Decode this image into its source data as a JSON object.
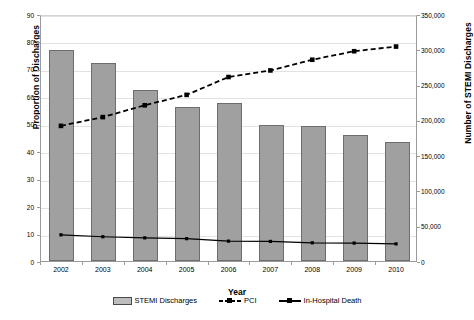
{
  "chart_data": {
    "type": "bar",
    "title": "",
    "xlabel": "Year",
    "ylabel": "Proportion of Discharges",
    "ylabel_secondary": "Number of STEMI Discharges",
    "categories": [
      "2002",
      "2003",
      "2004",
      "2005",
      "2006",
      "2007",
      "2008",
      "2009",
      "2010"
    ],
    "ylim": [
      0,
      90
    ],
    "yticks": [
      "0",
      "10",
      "20",
      "30",
      "40",
      "50",
      "60",
      "70",
      "80",
      "90"
    ],
    "ylim_secondary": [
      0,
      350000
    ],
    "yticks_secondary": [
      "0",
      "50,000",
      "100,000",
      "150,000",
      "200,000",
      "250,000",
      "300,000",
      "350,000"
    ],
    "grid": true,
    "legend_position": "bottom",
    "series": [
      {
        "name": "STEMI Discharges",
        "kind": "bar",
        "axis": "right",
        "color": "#a0a0a0",
        "values": [
          300000,
          281000,
          242000,
          218000,
          224000,
          192000,
          191000,
          178000,
          168000
        ],
        "values_left_axis": [
          77.0,
          72.2,
          62.3,
          56.0,
          57.5,
          49.4,
          49.2,
          45.8,
          43.2
        ]
      },
      {
        "name": "PCI",
        "kind": "line-dashed",
        "axis": "left",
        "color": "#000000",
        "values": [
          49.6,
          52.8,
          57.1,
          60.9,
          67.4,
          69.8,
          73.7,
          76.8,
          78.5
        ]
      },
      {
        "name": "In-Hospital Death",
        "kind": "line-solid",
        "axis": "left",
        "color": "#000000",
        "values": [
          9.9,
          9.2,
          8.8,
          8.5,
          7.6,
          7.5,
          7.0,
          6.9,
          6.6
        ]
      }
    ]
  },
  "legend": {
    "items": [
      {
        "label": "STEMI Discharges",
        "marker": "bar-swatch"
      },
      {
        "label": "PCI",
        "marker": "dashed-line-square-marker"
      },
      {
        "label": "In-Hospital Death",
        "marker": "solid-line-square-marker"
      }
    ]
  }
}
